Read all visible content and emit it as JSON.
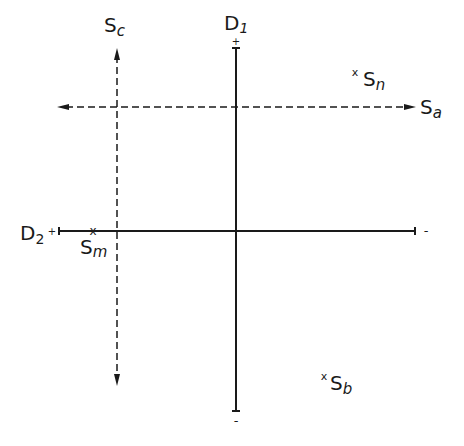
{
  "diagram": {
    "colors": {
      "ink": "#1a1a1a",
      "background": "#ffffff"
    },
    "axes": {
      "d1": {
        "label": "D",
        "subscript": "1",
        "plus": "+",
        "minus": "-",
        "style": "solid",
        "orientation": "vertical"
      },
      "d2": {
        "label": "D",
        "subscript": "2",
        "plus": "+",
        "minus": "-",
        "style": "solid",
        "orientation": "horizontal"
      },
      "sc": {
        "label": "S",
        "subscript": "c",
        "style": "dashed",
        "orientation": "vertical",
        "arrows": "both"
      },
      "sa": {
        "label": "S",
        "subscript": "a",
        "style": "dashed",
        "orientation": "horizontal",
        "arrows": "both"
      }
    },
    "points": [
      {
        "id": "sm",
        "marker": "x",
        "label": "S",
        "subscript": "m"
      },
      {
        "id": "sn",
        "marker": "x",
        "label": "S",
        "subscript": "n"
      },
      {
        "id": "sb",
        "marker": "x",
        "label": "S",
        "subscript": "b"
      }
    ]
  }
}
